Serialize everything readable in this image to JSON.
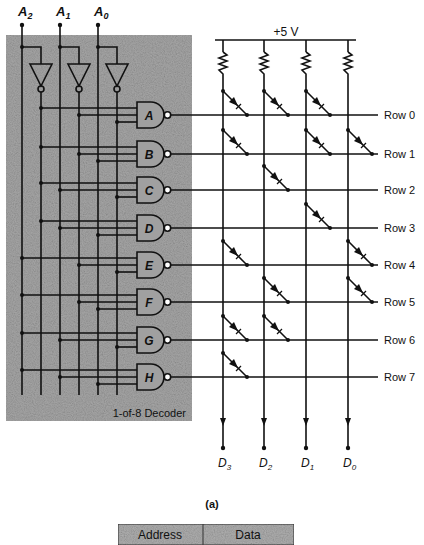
{
  "figure": {
    "caption": "(a)",
    "supply_label": "+5 V",
    "decoder_label": "1-of-8 Decoder"
  },
  "inputs": [
    {
      "name": "A",
      "sub": "2"
    },
    {
      "name": "A",
      "sub": "1"
    },
    {
      "name": "A",
      "sub": "0"
    }
  ],
  "gates": [
    "A",
    "B",
    "C",
    "D",
    "E",
    "F",
    "G",
    "H"
  ],
  "rows": [
    "Row 0",
    "Row 1",
    "Row 2",
    "Row 3",
    "Row 4",
    "Row 5",
    "Row 6",
    "Row 7"
  ],
  "outputs": [
    {
      "name": "D",
      "sub": "3"
    },
    {
      "name": "D",
      "sub": "2"
    },
    {
      "name": "D",
      "sub": "1"
    },
    {
      "name": "D",
      "sub": "0"
    }
  ],
  "diode_matrix": [
    [
      1,
      1,
      1,
      0
    ],
    [
      1,
      0,
      1,
      1
    ],
    [
      0,
      1,
      0,
      0
    ],
    [
      0,
      0,
      1,
      0
    ],
    [
      1,
      0,
      0,
      1
    ],
    [
      0,
      1,
      0,
      1
    ],
    [
      1,
      1,
      0,
      0
    ],
    [
      1,
      0,
      0,
      0
    ]
  ],
  "table": {
    "headers": [
      "Address",
      "Data"
    ]
  },
  "colors": {
    "line": "#111111",
    "shade": "#9a9a9a",
    "background": "#ffffff"
  }
}
